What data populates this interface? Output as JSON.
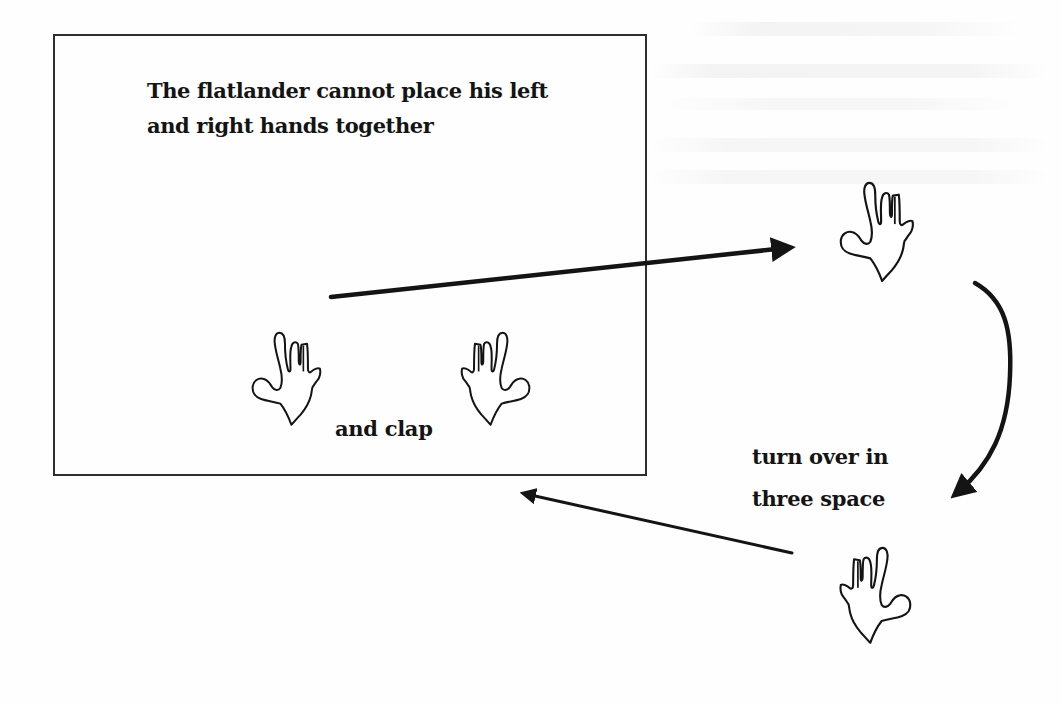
{
  "figure": {
    "title": "The flatlander cannot place his left and right hands together",
    "plane_label": {
      "line1": "The flatlander cannot place his left",
      "line2": "and right hands together"
    },
    "clap_label": "and clap",
    "turn_label": {
      "line1": "turn over in",
      "line2": "three space"
    },
    "elements": {
      "flatland_plane": "rectangle",
      "hands": [
        {
          "id": "left-hand-in-plane",
          "orientation": "thumb-left"
        },
        {
          "id": "right-hand-in-plane",
          "orientation": "thumb-right"
        },
        {
          "id": "hand-lifted",
          "orientation": "thumb-left"
        },
        {
          "id": "hand-flipped",
          "orientation": "thumb-right"
        }
      ],
      "arrows": [
        {
          "id": "arrow-lift-out",
          "from": "plane",
          "to": "hand-lifted"
        },
        {
          "id": "arrow-turn-over",
          "from": "hand-lifted",
          "to": "hand-flipped"
        },
        {
          "id": "arrow-return",
          "from": "hand-flipped",
          "to": "plane"
        }
      ]
    },
    "colors": {
      "ink": "#141414",
      "border": "#2e2e2e",
      "background": "#fefefe",
      "bleed_through": "#ececec"
    }
  }
}
